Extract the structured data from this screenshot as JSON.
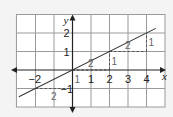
{
  "diagram": {
    "type": "coordinate-graph",
    "x_axis_label": "x",
    "y_axis_label": "y",
    "x_range": [
      -3,
      5
    ],
    "y_range": [
      -2,
      3
    ],
    "x_ticks": [
      {
        "value": -2,
        "label": "−2"
      },
      {
        "value": 1,
        "label": "1"
      },
      {
        "value": 2,
        "label": "2"
      },
      {
        "value": 3,
        "label": "3"
      },
      {
        "value": 4,
        "label": "4"
      }
    ],
    "y_ticks": [
      {
        "value": -1,
        "label": "−1"
      },
      {
        "value": 1,
        "label": "1"
      },
      {
        "value": 2,
        "label": "2"
      }
    ],
    "line": {
      "equation": "y = x/2",
      "slope": 0.5,
      "intercept": 0,
      "x_from": -2.9,
      "x_to": 4.5
    },
    "steps": [
      {
        "from": [
          -2,
          -1
        ],
        "run": 2,
        "rise": 1,
        "run_label": "2",
        "rise_label": "1"
      },
      {
        "from": [
          0,
          0
        ],
        "run": 2,
        "rise": 1,
        "run_label": "2",
        "rise_label": "1"
      },
      {
        "from": [
          2,
          1
        ],
        "run": 2,
        "rise": 1,
        "run_label": "2",
        "rise_label": "1"
      }
    ]
  }
}
